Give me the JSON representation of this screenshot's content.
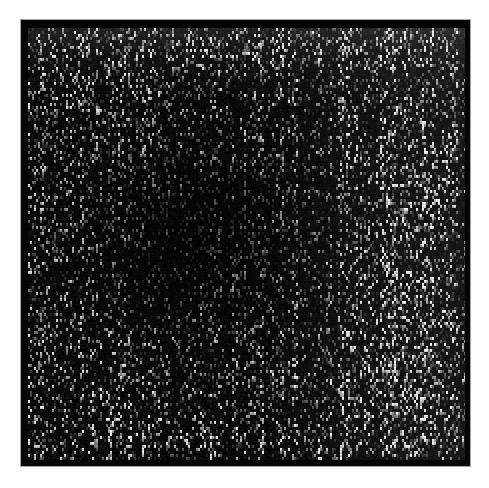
{
  "page": {
    "background_color": "#ffffff",
    "width": 489,
    "height": 488
  },
  "figure": {
    "name": "noise-texture",
    "title": "",
    "caption": "",
    "frame": {
      "border_color": "#0a0a0a",
      "fill_color": "#050505",
      "left": 21,
      "top": 20,
      "width": 449,
      "height": 446,
      "border_width_px": 6
    },
    "field": {
      "background_color": "#000000",
      "left": 6,
      "top": 7,
      "width": 437,
      "height": 432
    }
  },
  "chart_data": {
    "type": "heatmap",
    "title": "",
    "subtitle": "",
    "xlabel": "",
    "ylabel": "",
    "colormap": "grayscale",
    "grid": false,
    "legend": "none",
    "axis_visible": false,
    "tick_labels_x": [],
    "tick_labels_y": [],
    "description": "Dense random grayscale noise field; mostly near-black with sparse bright vertically-elongated speckles of 1-3 pixel grain.",
    "value_range": [
      0,
      255
    ],
    "mean_intensity": 46,
    "background_level": 6,
    "speckle_peak_level": 245,
    "speckle_density": 0.32,
    "grain": {
      "cell_width_px": 2,
      "cell_height_px": 3,
      "vertical_elongation": 1.6
    },
    "intensity_regions": [
      {
        "name": "top-band",
        "x_frac": [
          0.0,
          1.0
        ],
        "y_frac": [
          0.0,
          0.1
        ],
        "relative_brightness": 1.45
      },
      {
        "name": "upper-left",
        "x_frac": [
          0.0,
          0.35
        ],
        "y_frac": [
          0.05,
          0.35
        ],
        "relative_brightness": 1.05
      },
      {
        "name": "center-left-dark",
        "x_frac": [
          0.1,
          0.55
        ],
        "y_frac": [
          0.3,
          0.75
        ],
        "relative_brightness": 0.55
      },
      {
        "name": "center",
        "x_frac": [
          0.35,
          0.65
        ],
        "y_frac": [
          0.25,
          0.7
        ],
        "relative_brightness": 0.75
      },
      {
        "name": "right-column",
        "x_frac": [
          0.7,
          1.0
        ],
        "y_frac": [
          0.1,
          0.95
        ],
        "relative_brightness": 1.3
      },
      {
        "name": "bottom-right",
        "x_frac": [
          0.65,
          1.0
        ],
        "y_frac": [
          0.65,
          1.0
        ],
        "relative_brightness": 1.4
      },
      {
        "name": "bottom-band",
        "x_frac": [
          0.0,
          1.0
        ],
        "y_frac": [
          0.9,
          1.0
        ],
        "relative_brightness": 1.15
      }
    ],
    "colors": {
      "background": "#000000",
      "frame": "#0a0a0a",
      "page": "#ffffff",
      "speckle_low": "#3a3a3a",
      "speckle_mid": "#8a8a8a",
      "speckle_high": "#f2f2f2"
    },
    "seed": 20240517
  }
}
